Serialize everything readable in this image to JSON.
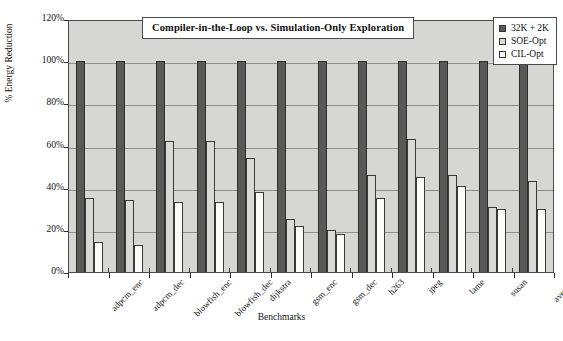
{
  "chart_data": {
    "type": "bar",
    "title": "Compiler-in-the-Loop vs. Simulation-Only Exploration",
    "xlabel": "Benchmarks",
    "ylabel": "% Energy Reduction",
    "ylim": [
      0,
      120
    ],
    "ytick_labels": [
      "120%",
      "100%",
      "80%",
      "60%",
      "40%",
      "20%",
      "0%"
    ],
    "ytick_values": [
      120,
      100,
      80,
      60,
      40,
      20,
      0
    ],
    "grid": true,
    "legend_position": "top-right",
    "categories": [
      "adpcm_enc",
      "adpcm_dec",
      "blowfish_enc",
      "blowfish_dec",
      "dijkstra",
      "gsm_enc",
      "gsm_dec",
      "h263",
      "jpeg",
      "lame",
      "susan",
      "average"
    ],
    "series": [
      {
        "name": "32K + 2K",
        "color": "#595959",
        "values": [
          100,
          100,
          100,
          100,
          100,
          100,
          100,
          100,
          100,
          100,
          100,
          100
        ]
      },
      {
        "name": "SOE-Opt",
        "color": "#d9d9d7",
        "values": [
          35,
          34,
          62,
          62,
          54,
          25,
          20,
          46,
          63,
          46,
          31,
          43
        ]
      },
      {
        "name": "CIL-Opt",
        "color": "#fbfbfa",
        "values": [
          14,
          13,
          33,
          33,
          38,
          22,
          18,
          35,
          45,
          41,
          30,
          30
        ]
      }
    ]
  },
  "figure": {
    "plot_background": "#d6d6d4",
    "axis_color": "#4a4a4a",
    "gridline_color": "#8f8f8f",
    "page_background": "#ffffff"
  }
}
